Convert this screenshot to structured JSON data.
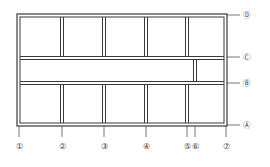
{
  "diagram": {
    "type": "structural-grid-plan",
    "colors": {
      "line": "#3a3a3a",
      "axis": "#555555",
      "background": "#ffffff"
    },
    "vertical_axes": [
      {
        "id": "1",
        "label": "①",
        "x": 18
      },
      {
        "id": "2",
        "label": "②",
        "x": 62
      },
      {
        "id": "3",
        "label": "③",
        "x": 104
      },
      {
        "id": "4",
        "label": "④",
        "x": 146
      },
      {
        "id": "5",
        "label": "⑤",
        "x": 187
      },
      {
        "id": "6",
        "label": "⑥",
        "x": 195
      },
      {
        "id": "7",
        "label": "⑦",
        "x": 226
      }
    ],
    "horizontal_axes": [
      {
        "id": "D",
        "label": "Ⓓ",
        "y": 15
      },
      {
        "id": "C",
        "label": "Ⓒ",
        "y": 58
      },
      {
        "id": "B",
        "label": "Ⓑ",
        "y": 83
      },
      {
        "id": "A",
        "label": "Ⓐ",
        "y": 125
      }
    ]
  }
}
